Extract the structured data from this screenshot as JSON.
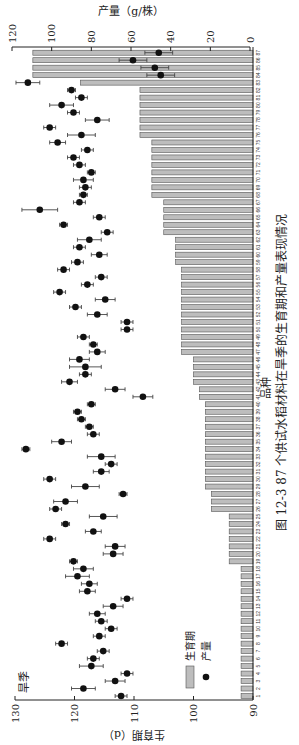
{
  "figure": {
    "caption": "图 12-3   87 个供试水稻材料在旱季的生育期和产量表现情况",
    "season_label": "旱季"
  },
  "chart_data": {
    "type": "bar",
    "title": "87 个供试水稻材料在旱季的生育期和产量表现情况",
    "xlabel": "品种",
    "ylabel_left": "生育期（d）",
    "ylabel_right": "产量（g/株）",
    "ylim_left": [
      90,
      130
    ],
    "ylim_right": [
      0,
      120
    ],
    "yticks_left": [
      90,
      100,
      110,
      120,
      130
    ],
    "yticks_right": [
      0,
      20,
      40,
      60,
      80,
      100,
      120
    ],
    "grid": false,
    "legend_position": "lower-left inside",
    "legend": [
      {
        "name": "生育期",
        "marker": "bar",
        "color": "#bdbdbd"
      },
      {
        "name": "产量",
        "marker": "dot",
        "color": "#111111"
      }
    ],
    "categories": [
      1,
      2,
      3,
      4,
      5,
      6,
      7,
      8,
      9,
      10,
      11,
      12,
      13,
      14,
      15,
      16,
      17,
      18,
      19,
      20,
      21,
      22,
      23,
      24,
      25,
      26,
      27,
      28,
      29,
      30,
      31,
      32,
      33,
      34,
      35,
      36,
      37,
      38,
      39,
      40,
      41,
      42,
      43,
      44,
      45,
      46,
      47,
      48,
      49,
      50,
      51,
      52,
      53,
      54,
      55,
      56,
      57,
      58,
      59,
      60,
      61,
      62,
      63,
      64,
      65,
      66,
      67,
      68,
      69,
      70,
      71,
      72,
      73,
      74,
      75,
      76,
      77,
      78,
      79,
      80,
      81,
      82,
      83,
      84,
      85,
      86,
      87
    ],
    "series": [
      {
        "name": "生育期",
        "type": "bar",
        "axis": "left",
        "unit": "d",
        "values": [
          92,
          92,
          92,
          92,
          92,
          92,
          92,
          92,
          92,
          92,
          92,
          92,
          92,
          92,
          92,
          92,
          92,
          92,
          94,
          94,
          94,
          94,
          94,
          94,
          94,
          97,
          97,
          97,
          98,
          98,
          98,
          98,
          98,
          98,
          98,
          98,
          98,
          98,
          98,
          98,
          99,
          99,
          100,
          100,
          100,
          100,
          102,
          102,
          102,
          102,
          102,
          102,
          102,
          102,
          102,
          102,
          102,
          102,
          103,
          103,
          103,
          103,
          105,
          105,
          105,
          105,
          105,
          107,
          107,
          107,
          107,
          107,
          107,
          107,
          107,
          109,
          109,
          109,
          109,
          109,
          109,
          109,
          119,
          127,
          127,
          127,
          127
        ]
      },
      {
        "name": "产量",
        "type": "scatter",
        "axis": "right",
        "unit": "g/株",
        "values": [
          65,
          84,
          68,
          62,
          80,
          79,
          74,
          95,
          76,
          70,
          75,
          77,
          69,
          62,
          82,
          81,
          87,
          84,
          89,
          69,
          68,
          101,
          79,
          93,
          74,
          98,
          93,
          64,
          83,
          101,
          75,
          70,
          75,
          113,
          95,
          79,
          81,
          85,
          87,
          80,
          54,
          68,
          91,
          83,
          83,
          86,
          77,
          79,
          84,
          62,
          62,
          77,
          88,
          73,
          96,
          82,
          75,
          94,
          87,
          76,
          86,
          81,
          72,
          94,
          76,
          106,
          86,
          84,
          83,
          84,
          80,
          86,
          89,
          82,
          97,
          85,
          101,
          77,
          89,
          95,
          85,
          90,
          112,
          45,
          48,
          59,
          46
        ],
        "error": [
          3,
          6,
          5,
          3,
          6,
          3,
          3,
          3,
          3,
          3,
          3,
          4,
          5,
          3,
          4,
          4,
          6,
          5,
          2,
          5,
          5,
          3,
          4,
          2,
          7,
          3,
          6,
          2,
          7,
          3,
          4,
          3,
          7,
          2,
          5,
          3,
          2,
          2,
          2,
          2,
          5,
          5,
          4,
          3,
          8,
          5,
          4,
          2,
          3,
          3,
          3,
          5,
          3,
          5,
          3,
          3,
          3,
          3,
          3,
          4,
          3,
          6,
          3,
          2,
          3,
          9,
          3,
          2,
          3,
          5,
          2,
          3,
          3,
          3,
          4,
          7,
          3,
          6,
          3,
          6,
          3,
          2,
          6,
          7,
          7,
          7,
          7
        ]
      }
    ]
  }
}
